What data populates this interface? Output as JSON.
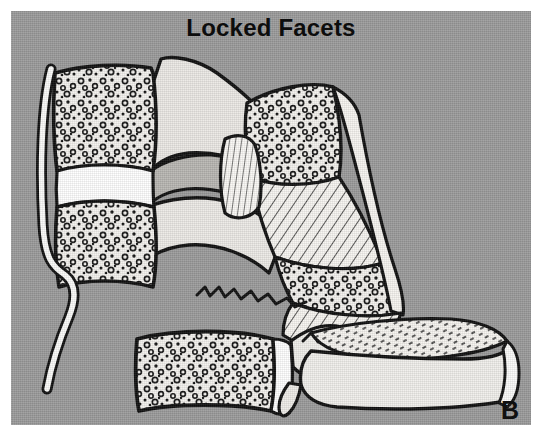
{
  "figure": {
    "title": "Locked Facets",
    "panel_label": "B",
    "domain_type": "medical-line-illustration",
    "width": 542,
    "height": 437
  },
  "colors": {
    "page_background": "#ffffff",
    "panel_background": "#9b9b9b",
    "ink": "#0d0d0d",
    "bone_fill": "#f2f0ec",
    "bone_shadow": "#c9c7c3",
    "ligament_fill": "#fbfbf9",
    "disc_fill": "#ffffff",
    "title_color": "#0d0d0d",
    "label_color": "#101010"
  },
  "panel": {
    "left": 11,
    "top": 11,
    "width": 520,
    "height": 414
  },
  "anatomy": {
    "parts": [
      {
        "id": "upper-vertebral-body",
        "label": "Upper vertebral body",
        "texture": "trabecular-stipple"
      },
      {
        "id": "intervertebral-disc-upper",
        "label": "Intervertebral disc",
        "texture": "plain"
      },
      {
        "id": "second-vertebral-body",
        "label": "Second vertebral body",
        "texture": "trabecular-stipple"
      },
      {
        "id": "anterior-longitudinal-ligament",
        "label": "Torn anterior longitudinal ligament",
        "texture": "plain"
      },
      {
        "id": "posterior-elements-upper",
        "label": "Posterior elements / lamina",
        "texture": "shaded"
      },
      {
        "id": "dislocated-vertebra",
        "label": "Anteriorly displaced vertebra",
        "texture": "hatched"
      },
      {
        "id": "locked-facet-joint",
        "label": "Locked facet joint",
        "texture": "shaded"
      },
      {
        "id": "torn-ligament-flap",
        "label": "Torn posterior ligament flap",
        "texture": "fine-hatch"
      },
      {
        "id": "lower-vertebral-body",
        "label": "Lower vertebral body",
        "texture": "trabecular-stipple"
      },
      {
        "id": "lower-posterior-element",
        "label": "Lower lamina and spinous process",
        "texture": "hatched"
      },
      {
        "id": "spinous-process-tip",
        "label": "Spinous process",
        "texture": "plain"
      }
    ]
  }
}
